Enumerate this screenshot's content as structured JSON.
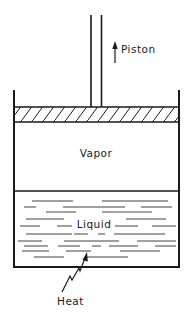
{
  "diagram": {
    "type": "piston-cylinder schematic",
    "labels": {
      "piston": "Piston",
      "vapor": "Vapor",
      "liquid": "Liquid",
      "heat": "Heat"
    },
    "colors": {
      "ink": "#1a1a1a",
      "background": "#ffffff"
    },
    "components": [
      {
        "name": "piston-rod",
        "direction": "up"
      },
      {
        "name": "piston-head",
        "fill": "hatched"
      },
      {
        "name": "vapor-region"
      },
      {
        "name": "liquid-region"
      },
      {
        "name": "heat-input-arrow"
      }
    ]
  }
}
